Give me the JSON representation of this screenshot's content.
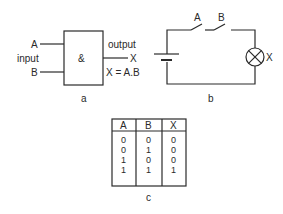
{
  "panel_a": {
    "caption": "a",
    "gate_symbol": "&",
    "input_label": "input",
    "input_a": "A",
    "input_b": "B",
    "output_label": "output",
    "output_x": "X",
    "equation": "X = A.B"
  },
  "panel_b": {
    "caption": "b",
    "switch_a": "A",
    "switch_b": "B",
    "lamp_label": "X"
  },
  "panel_c": {
    "caption": "c",
    "headers": [
      "A",
      "B",
      "X"
    ],
    "rows": [
      [
        "0",
        "0",
        "0"
      ],
      [
        "0",
        "1",
        "0"
      ],
      [
        "1",
        "0",
        "0"
      ],
      [
        "1",
        "1",
        "1"
      ]
    ]
  }
}
